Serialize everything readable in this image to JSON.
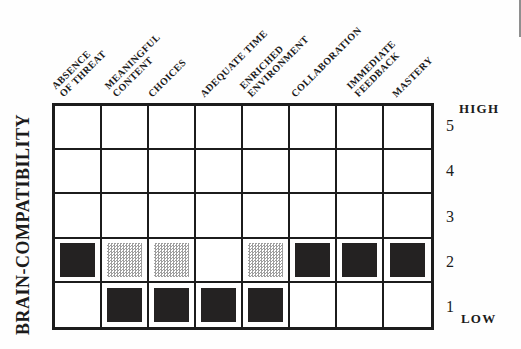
{
  "figure": {
    "y_axis_label": "BRAIN-COMPATIBILITY",
    "scale_top": "HIGH",
    "scale_bottom": "LOW"
  },
  "chart_data": {
    "type": "heatmap",
    "title": "",
    "xlabel": "",
    "ylabel": "BRAIN-COMPATIBILITY",
    "grid": true,
    "legend_position": "none",
    "y_range": [
      1,
      5
    ],
    "row_labels": [
      5,
      4,
      3,
      2,
      1
    ],
    "y_scale_annotations": {
      "top": "HIGH",
      "bottom": "LOW"
    },
    "categories": [
      "ABSENCE OF THREAT",
      "MEANINGFUL CONTENT",
      "CHOICES",
      "ADEQUATE TIME",
      "ENRICHED ENVIRONMENT",
      "COLLABORATION",
      "IMMEDIATE FEEDBACK",
      "MASTERY"
    ],
    "categories_display": [
      [
        "ABSENCE",
        "OF THREAT"
      ],
      [
        "MEANINGFUL",
        "CONTENT"
      ],
      [
        "CHOICES"
      ],
      [
        "ADEQUATE TIME"
      ],
      [
        "ENRICHED",
        "ENVIRONMENT"
      ],
      [
        "COLLABORATION"
      ],
      [
        "IMMEDIATE",
        "FEEDBACK"
      ],
      [
        "MASTERY"
      ]
    ],
    "marks": [
      {
        "category": "ABSENCE OF THREAT",
        "col": 0,
        "row": 2,
        "style": "solid"
      },
      {
        "category": "MEANINGFUL CONTENT",
        "col": 1,
        "row": 2,
        "style": "stippled"
      },
      {
        "category": "MEANINGFUL CONTENT",
        "col": 1,
        "row": 1,
        "style": "solid"
      },
      {
        "category": "CHOICES",
        "col": 2,
        "row": 2,
        "style": "stippled"
      },
      {
        "category": "CHOICES",
        "col": 2,
        "row": 1,
        "style": "solid"
      },
      {
        "category": "ADEQUATE TIME",
        "col": 3,
        "row": 1,
        "style": "solid"
      },
      {
        "category": "ENRICHED ENVIRONMENT",
        "col": 4,
        "row": 2,
        "style": "stippled"
      },
      {
        "category": "ENRICHED ENVIRONMENT",
        "col": 4,
        "row": 1,
        "style": "solid"
      },
      {
        "category": "COLLABORATION",
        "col": 5,
        "row": 2,
        "style": "solid"
      },
      {
        "category": "IMMEDIATE FEEDBACK",
        "col": 6,
        "row": 2,
        "style": "solid"
      },
      {
        "category": "MASTERY",
        "col": 7,
        "row": 2,
        "style": "solid"
      }
    ],
    "colors": {
      "grid_line": "#1c1c1c",
      "background": "#ffffff",
      "solid_mark": "#242222",
      "stipple_dot": "#9e9e9e"
    }
  }
}
